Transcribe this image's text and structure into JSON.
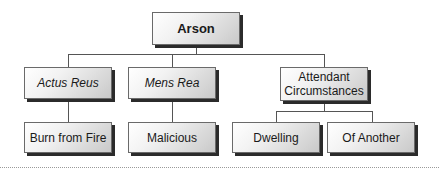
{
  "diagram": {
    "type": "tree",
    "root": {
      "label": "Arson"
    },
    "level1": [
      {
        "label": "Actus Reus",
        "italic": true
      },
      {
        "label": "Mens Rea",
        "italic": true
      },
      {
        "label": "Attendant Circumstances",
        "italic": false
      }
    ],
    "level2": [
      {
        "label": "Burn from Fire",
        "parent": "Actus Reus"
      },
      {
        "label": "Malicious",
        "parent": "Mens Rea"
      },
      {
        "label": "Dwelling",
        "parent": "Attendant Circumstances"
      },
      {
        "label": "Of Another",
        "parent": "Attendant Circumstances"
      }
    ],
    "colors": {
      "box_border": "#6a6a6a",
      "box_shadow": "#2b2b2b",
      "connector": "#555555",
      "text": "#1a1a1a"
    }
  }
}
